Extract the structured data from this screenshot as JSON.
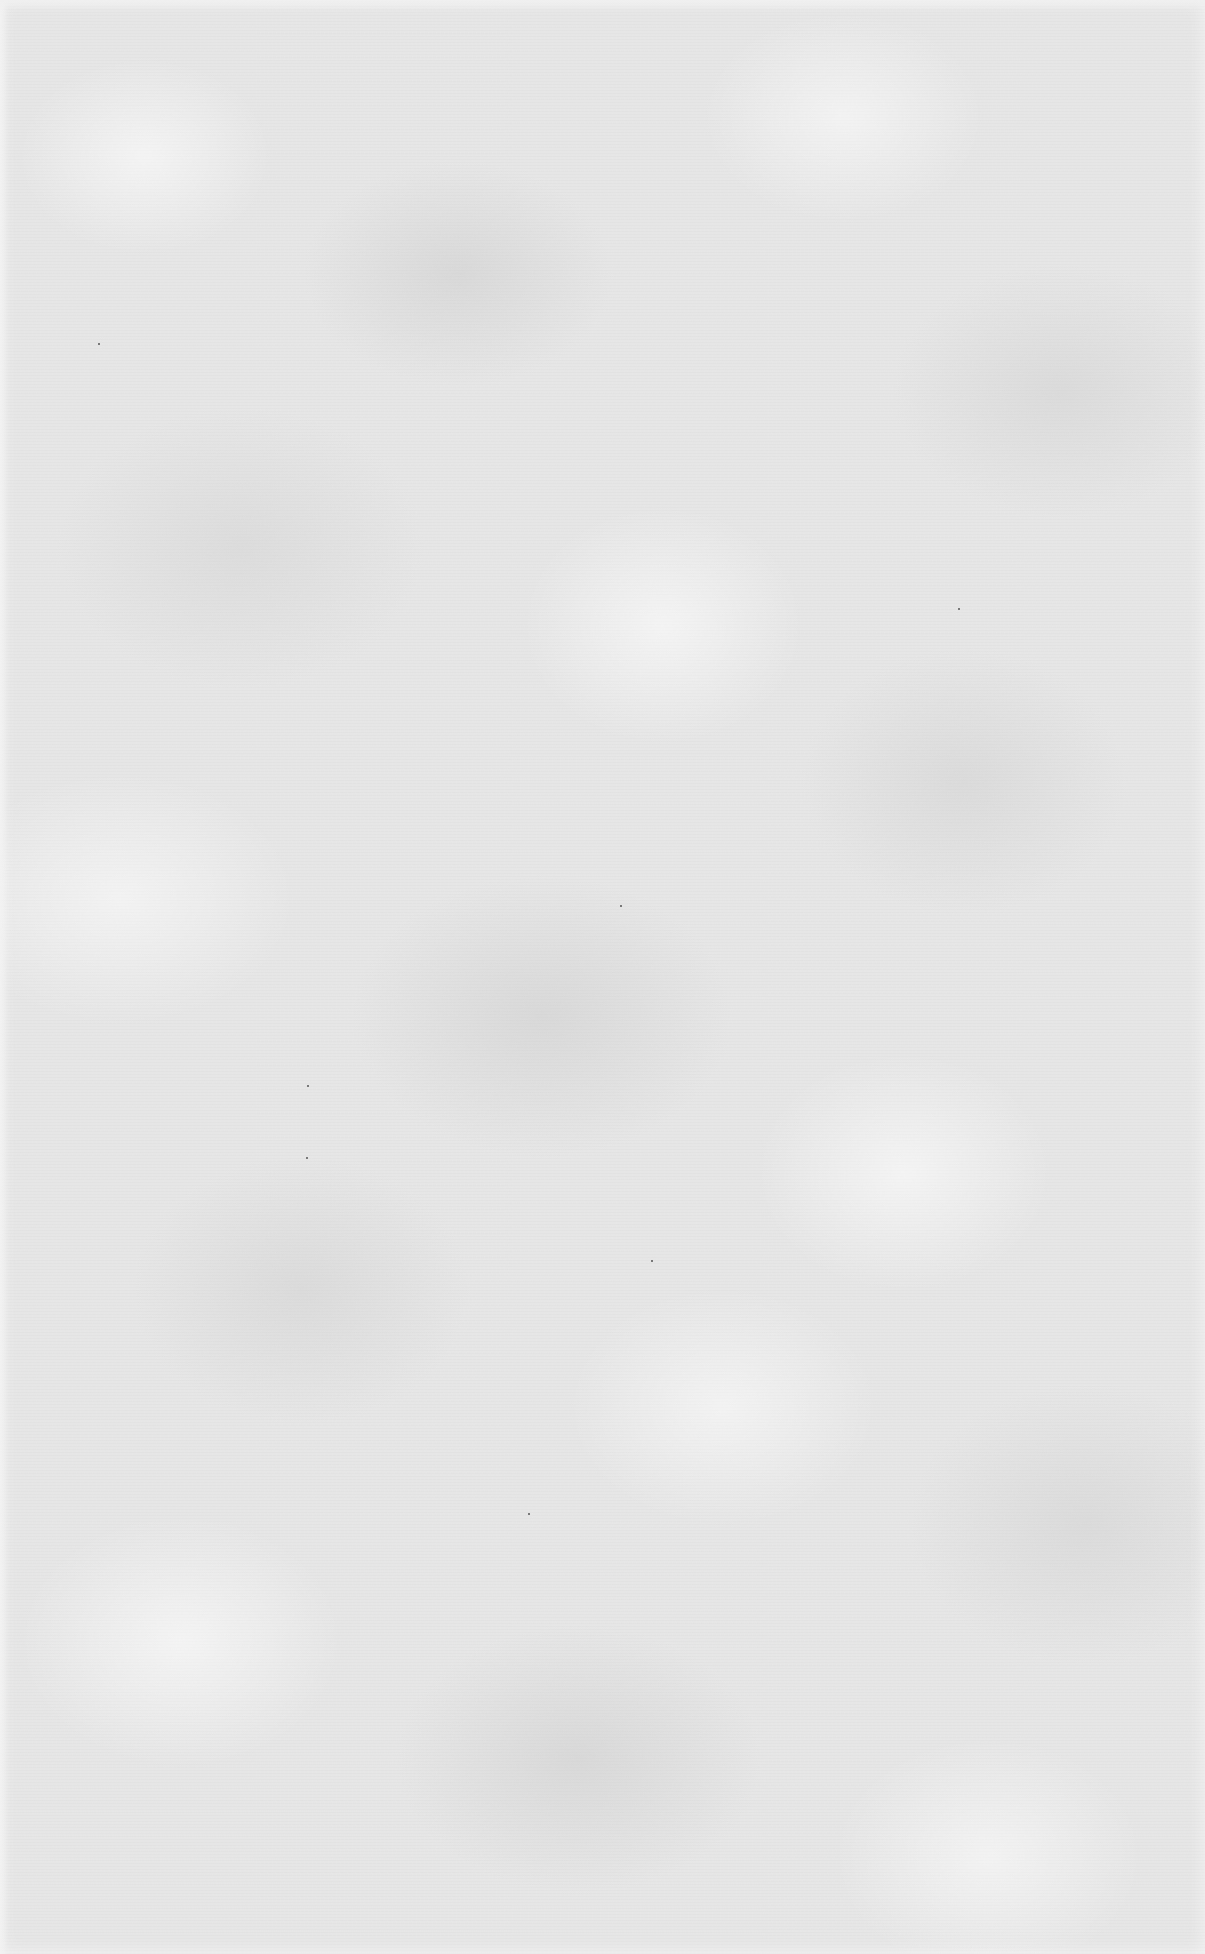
{
  "page": {
    "type": "blank scanned paper",
    "background_color": "#e6e6e6",
    "text_content": ""
  },
  "specks": [
    {
      "x": 98,
      "y": 343
    },
    {
      "x": 307,
      "y": 1085
    },
    {
      "x": 306,
      "y": 1157
    },
    {
      "x": 651,
      "y": 1260
    },
    {
      "x": 620,
      "y": 905
    },
    {
      "x": 958,
      "y": 608
    },
    {
      "x": 528,
      "y": 1513
    }
  ]
}
